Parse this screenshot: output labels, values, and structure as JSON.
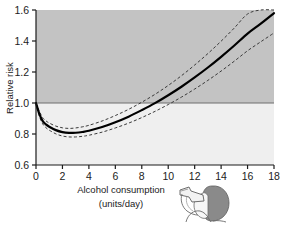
{
  "chart_data": {
    "type": "line",
    "title": "",
    "xlabel": "Alcohol consumption (units/day)",
    "xlabel_line1": "Alcohol consumption",
    "xlabel_line2": "(units/day)",
    "ylabel": "Relative risk",
    "xlim": [
      0,
      18
    ],
    "ylim": [
      0.6,
      1.6
    ],
    "xticks": [
      0,
      2,
      4,
      6,
      8,
      10,
      12,
      14,
      16,
      18
    ],
    "xtick_labels": [
      "0",
      "2",
      "4",
      "6",
      "8",
      "10",
      "12",
      "14",
      "16",
      "18"
    ],
    "yticks": [
      0.6,
      0.8,
      1.0,
      1.2,
      1.4,
      1.6
    ],
    "ytick_labels": [
      "0.6",
      "0.8",
      "1.0",
      "1.2",
      "1.4",
      "1.6"
    ],
    "grid": false,
    "legend": null,
    "reference_line": {
      "axis": "y",
      "value": 1.0,
      "label": "",
      "color": "#6e6e6e"
    },
    "shading": {
      "above_reference_color": "#c3c3c3",
      "below_reference_color": "#efefef",
      "description": "Plot background shaded darker above relative risk 1.0 and lighter below"
    },
    "x": [
      0,
      0.25,
      0.5,
      0.75,
      1,
      1.5,
      2,
      2.5,
      3,
      3.5,
      4,
      5,
      6,
      7,
      8,
      9,
      10,
      11,
      12,
      13,
      14,
      15,
      16,
      17,
      18
    ],
    "series": [
      {
        "name": "Relative risk",
        "style": "solid",
        "color": "#000000",
        "width": 2.2,
        "values": [
          1.0,
          0.93,
          0.885,
          0.862,
          0.847,
          0.825,
          0.812,
          0.807,
          0.808,
          0.813,
          0.821,
          0.845,
          0.876,
          0.912,
          0.954,
          0.999,
          1.05,
          1.105,
          1.165,
          1.229,
          1.298,
          1.371,
          1.448,
          1.512,
          1.58
        ]
      },
      {
        "name": "Upper 95% confidence limit",
        "style": "dashed",
        "color": "#3a3a3a",
        "width": 1,
        "values": [
          1.0,
          0.947,
          0.906,
          0.885,
          0.871,
          0.851,
          0.84,
          0.836,
          0.839,
          0.846,
          0.856,
          0.884,
          0.919,
          0.959,
          1.005,
          1.056,
          1.113,
          1.176,
          1.245,
          1.319,
          1.399,
          1.484,
          1.574,
          1.6,
          1.6
        ]
      },
      {
        "name": "Lower 95% confidence limit",
        "style": "dashed",
        "color": "#3a3a3a",
        "width": 1,
        "values": [
          1.0,
          0.915,
          0.866,
          0.841,
          0.825,
          0.801,
          0.787,
          0.781,
          0.781,
          0.785,
          0.792,
          0.812,
          0.839,
          0.87,
          0.906,
          0.946,
          0.99,
          1.038,
          1.09,
          1.146,
          1.206,
          1.27,
          1.337,
          1.395,
          1.452
        ]
      }
    ],
    "annotations": [
      {
        "name": "drinking-person-illustration",
        "description": "Line drawing of a person in profile drinking from a bottle",
        "x_px": 176,
        "y_px": 180
      }
    ]
  }
}
